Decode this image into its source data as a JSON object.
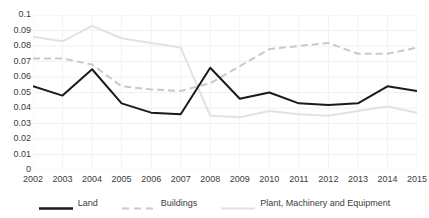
{
  "chart_data": {
    "type": "line",
    "title": "",
    "xlabel": "",
    "ylabel": "",
    "grid": true,
    "legend_position": "bottom",
    "categories": [
      "2002",
      "2003",
      "2004",
      "2005",
      "2006",
      "2007",
      "2008",
      "2009",
      "2010",
      "2011",
      "2012",
      "2013",
      "2014",
      "2015"
    ],
    "ylim": [
      0,
      0.1
    ],
    "ytick_labels": [
      "0.1",
      "0.09",
      "0.08",
      "0.07",
      "0.06",
      "0.05",
      "0.04",
      "0.03",
      "0.02",
      "0.01",
      "0"
    ],
    "ytick_values": [
      0.1,
      0.09,
      0.08,
      0.07,
      0.06,
      0.05,
      0.04,
      0.03,
      0.02,
      0.01,
      0
    ],
    "series": [
      {
        "name": "Land",
        "color": "#1a1a1a",
        "style": "solid",
        "width": 2,
        "values": [
          0.054,
          0.048,
          0.065,
          0.043,
          0.037,
          0.036,
          0.066,
          0.046,
          0.05,
          0.043,
          0.042,
          0.043,
          0.054,
          0.051
        ]
      },
      {
        "name": "Buildings",
        "color": "#c9c9c9",
        "style": "dashed",
        "width": 2,
        "values": [
          0.072,
          0.072,
          0.068,
          0.054,
          0.052,
          0.051,
          0.056,
          0.067,
          0.078,
          0.08,
          0.082,
          0.075,
          0.075,
          0.079
        ]
      },
      {
        "name": "Plant, Machinery and Equipment",
        "color": "#e2e2e2",
        "style": "solid",
        "width": 2,
        "values": [
          0.086,
          0.083,
          0.093,
          0.085,
          0.082,
          0.079,
          0.035,
          0.034,
          0.038,
          0.036,
          0.035,
          0.038,
          0.041,
          0.037
        ]
      }
    ]
  },
  "legend": {
    "items": [
      {
        "label": "Land",
        "color": "#1a1a1a",
        "style": "solid"
      },
      {
        "label": "Buildings",
        "color": "#c9c9c9",
        "style": "dashed"
      },
      {
        "label": "Plant, Machinery and Equipment",
        "color": "#e2e2e2",
        "style": "solid"
      }
    ]
  }
}
